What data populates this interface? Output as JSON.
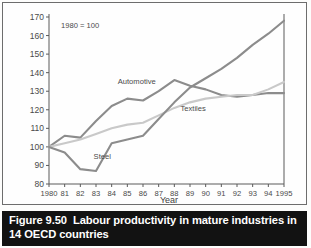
{
  "figure": {
    "caption_number": "Figure 9.50",
    "caption_body": "Labour productivity in mature industries in 14 OECD countries"
  },
  "chart_data": {
    "type": "line",
    "title": "",
    "annotation": "1980 = 100",
    "xlabel": "Year",
    "ylabel": "",
    "categories": [
      "1980",
      "81",
      "82",
      "83",
      "84",
      "85",
      "86",
      "87",
      "88",
      "89",
      "90",
      "91",
      "92",
      "93",
      "94",
      "1995"
    ],
    "x": [
      1980,
      1981,
      1982,
      1983,
      1984,
      1985,
      1986,
      1987,
      1988,
      1989,
      1990,
      1991,
      1992,
      1993,
      1994,
      1995
    ],
    "xlim": [
      1980,
      1995
    ],
    "ylim": [
      80,
      170
    ],
    "yticks": [
      80,
      90,
      100,
      110,
      120,
      130,
      140,
      150,
      160,
      170
    ],
    "grid": false,
    "legend": "inline-labels",
    "series": [
      {
        "name": "Automotive",
        "color": "#8c8c8c",
        "label_x": 1985.6,
        "label_y": 134.0,
        "values": [
          100,
          106,
          105,
          114,
          122,
          126,
          125,
          130,
          136,
          133,
          131,
          128,
          127,
          128,
          129,
          129
        ]
      },
      {
        "name": "Textiles",
        "color": "#c9c9c9",
        "label_x": 1989.2,
        "label_y": 119.5,
        "values": [
          100,
          102,
          104,
          107,
          110,
          112,
          113,
          117,
          121,
          124,
          126,
          127,
          128,
          128,
          131,
          135
        ]
      },
      {
        "name": "Steel",
        "color": "#8c8c8c",
        "label_x": 1983.4,
        "label_y": 93.5,
        "values": [
          100,
          97,
          88,
          87,
          102,
          104,
          106,
          115,
          124,
          132,
          137,
          142,
          148,
          155,
          161,
          168
        ]
      }
    ]
  }
}
